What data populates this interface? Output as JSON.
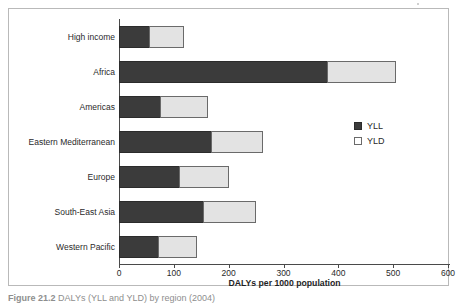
{
  "chart_data": {
    "type": "bar",
    "orientation": "horizontal",
    "stacked": true,
    "title": "",
    "xlabel": "DALYs per 1000 population",
    "ylabel": "",
    "xlim": [
      0,
      600
    ],
    "xticks": [
      0,
      100,
      200,
      300,
      400,
      500,
      600
    ],
    "grid": false,
    "legend_position": "right",
    "categories": [
      "High income",
      "Africa",
      "Americas",
      "Eastern Mediterranean",
      "Europe",
      "South-East Asia",
      "Western Pacific"
    ],
    "series": [
      {
        "name": "YLL",
        "color": "#3b3b3b",
        "values": [
          55,
          380,
          75,
          168,
          110,
          153,
          72
        ]
      },
      {
        "name": "YLD",
        "color": "#e3e3e3",
        "values": [
          64,
          125,
          87,
          95,
          90,
          97,
          71
        ]
      }
    ],
    "totals": [
      119,
      505,
      162,
      263,
      200,
      250,
      143
    ]
  },
  "legend": {
    "items": [
      {
        "label": "YLL",
        "swatch": "filled-dark-square"
      },
      {
        "label": "YLD",
        "swatch": "open-light-square"
      }
    ]
  },
  "axis": {
    "x_title": "DALYs per 1000 population",
    "tick_labels": [
      "0",
      "100",
      "200",
      "300",
      "400",
      "500",
      "600"
    ]
  },
  "caption": {
    "number": "Figure 21.2",
    "text": "DALYs (YLL and YLD) by region (2004)"
  },
  "colors": {
    "yll": "#3b3b3b",
    "yld": "#e3e3e3",
    "axis": "#4a4a4a",
    "frame": "#b9b9b9",
    "text": "#2a2a2a"
  }
}
